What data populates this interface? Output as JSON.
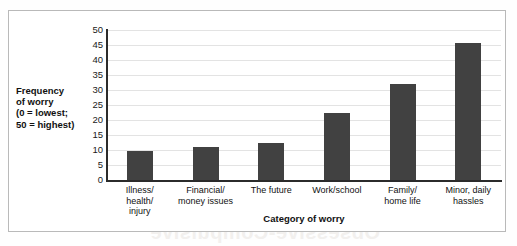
{
  "chart_data": {
    "type": "bar",
    "title": "",
    "categories": [
      "Illness/\nhealth/\ninjury",
      "Financial/\nmoney issues",
      "The future",
      "Work/school",
      "Family/\nhome life",
      "Minor, daily\nhassles"
    ],
    "category_lines": [
      [
        "Illness/",
        "health/",
        "injury"
      ],
      [
        "Financial/",
        "money issues"
      ],
      [
        "The future"
      ],
      [
        "Work/school"
      ],
      [
        "Family/",
        "home life"
      ],
      [
        "Minor, daily",
        "hassles"
      ]
    ],
    "values": [
      9.7,
      11.0,
      12.5,
      22.5,
      32.0,
      45.7
    ],
    "xlabel": "Category of worry",
    "ylabel": "Frequency of worry (0 = lowest; 50 = highest)",
    "ylabel_lines": [
      "Frequency",
      "of worry",
      "(0 = lowest;",
      "50 = highest)"
    ],
    "ylim": [
      0,
      50
    ],
    "ytick_values": [
      0,
      5,
      10,
      15,
      20,
      25,
      30,
      35,
      40,
      45,
      50
    ],
    "ytick_labels": [
      "0",
      "5",
      "10",
      "15",
      "20",
      "25",
      "30",
      "35",
      "40",
      "45",
      "50"
    ],
    "grid": true,
    "legend": null,
    "bar_color": "#414141",
    "axis_color": "#2b2b2b",
    "gridline_color": "#e3e3e3",
    "frame_color": "#b9b9b9"
  },
  "artifacts": {
    "bleed_text": "Obsessive-Compulsive"
  }
}
